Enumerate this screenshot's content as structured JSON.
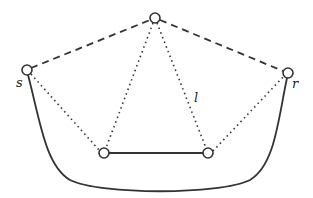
{
  "diagram": {
    "nodes": [
      {
        "id": "top",
        "x": 155,
        "y": 18
      },
      {
        "id": "s",
        "x": 27,
        "y": 70,
        "label": "s"
      },
      {
        "id": "r",
        "x": 288,
        "y": 73,
        "label": "r"
      },
      {
        "id": "bottom-left",
        "x": 104,
        "y": 153
      },
      {
        "id": "bottom-right",
        "x": 208,
        "y": 153
      }
    ],
    "edges": [
      {
        "from": "s",
        "to": "top",
        "style": "dashed"
      },
      {
        "from": "top",
        "to": "r",
        "style": "dashed"
      },
      {
        "from": "s",
        "to": "bottom-left",
        "style": "dotted"
      },
      {
        "from": "top",
        "to": "bottom-left",
        "style": "dotted"
      },
      {
        "from": "top",
        "to": "bottom-right",
        "style": "dotted"
      },
      {
        "from": "bottom-right",
        "to": "r",
        "style": "dotted"
      },
      {
        "from": "bottom-left",
        "to": "bottom-right",
        "style": "solid"
      },
      {
        "from": "s",
        "to": "r",
        "style": "solid-curve"
      }
    ],
    "labels": {
      "s": "s",
      "r": "r",
      "l": "l"
    }
  }
}
